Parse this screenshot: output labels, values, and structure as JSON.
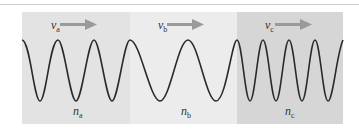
{
  "diagram": {
    "regions": [
      {
        "id": "a",
        "velocity_label": "v",
        "velocity_sub": "a",
        "index_label": "n",
        "index_sub": "a",
        "color": "#e3e3e3"
      },
      {
        "id": "b",
        "velocity_label": "v",
        "velocity_sub": "b",
        "index_label": "n",
        "index_sub": "b",
        "color": "#ececec"
      },
      {
        "id": "c",
        "velocity_label": "v",
        "velocity_sub": "c",
        "index_label": "n",
        "index_sub": "c",
        "color": "#d6d6d6"
      }
    ],
    "arrow_color": "#9a9a9a",
    "wave_color": "#2a2a2a"
  }
}
